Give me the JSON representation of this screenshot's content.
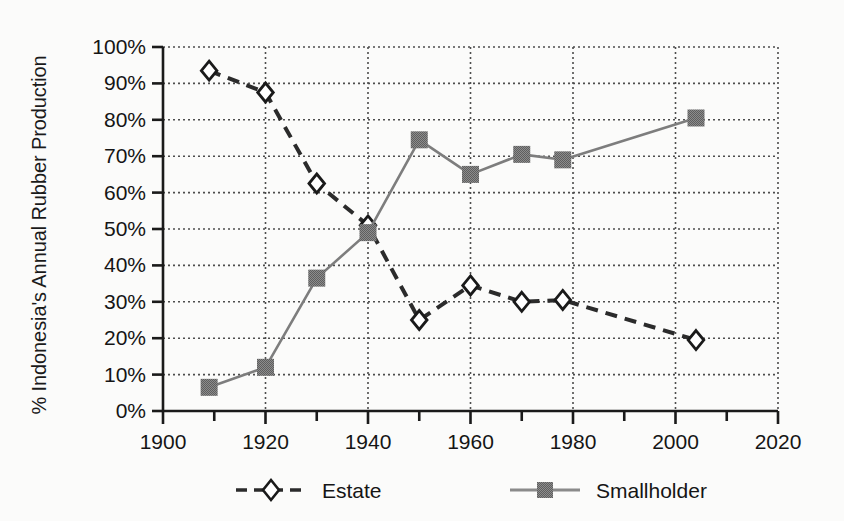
{
  "chart_data": {
    "type": "line",
    "title": "",
    "xlabel": "",
    "ylabel": "% Indonesia's Annual Rubber Production",
    "xlim": [
      1900,
      2020
    ],
    "ylim": [
      0,
      100
    ],
    "xticks": [
      1900,
      1920,
      1940,
      1960,
      1980,
      2000,
      2020
    ],
    "xtick_labels": [
      "1900",
      "1920",
      "1940",
      "1960",
      "1980",
      "2000",
      "2020"
    ],
    "x_minor_tick_interval": 10,
    "yticks": [
      0,
      10,
      20,
      30,
      40,
      50,
      60,
      70,
      80,
      90,
      100
    ],
    "ytick_labels": [
      "0%",
      "10%",
      "20%",
      "30%",
      "40%",
      "50%",
      "60%",
      "70%",
      "80%",
      "90%",
      "100%"
    ],
    "grid": "dotted-both-axes",
    "legend_position": "bottom",
    "series": [
      {
        "name": "Estate",
        "line_style": "dashed",
        "color": "#2b2b2b",
        "marker": "diamond-open",
        "marker_fill": "#ffffff",
        "x": [
          1909,
          1920,
          1930,
          1940,
          1950,
          1960,
          1970,
          1978,
          2004
        ],
        "values": [
          93.5,
          87.5,
          62.5,
          51.0,
          25.0,
          34.5,
          30.0,
          30.5,
          19.5
        ]
      },
      {
        "name": "Smallholder",
        "line_style": "solid",
        "color": "#7d7d7d",
        "marker": "square-filled",
        "marker_fill": "#7a7a7a",
        "x": [
          1909,
          1920,
          1930,
          1940,
          1950,
          1960,
          1970,
          1978,
          2004
        ],
        "values": [
          6.5,
          12.0,
          36.5,
          49.0,
          74.5,
          65.0,
          70.5,
          69.0,
          80.5
        ]
      }
    ]
  },
  "legend": {
    "entries": [
      {
        "label": "Estate"
      },
      {
        "label": "Smallholder"
      }
    ]
  },
  "axes": {
    "y_title": "% Indonesia's Annual Rubber Production"
  },
  "colors": {
    "background": "#fbfbfa",
    "axis": "#1a1a1a",
    "grid": "#4d4d4d",
    "estate": "#2b2b2b",
    "smallholder": "#7d7d7d"
  }
}
